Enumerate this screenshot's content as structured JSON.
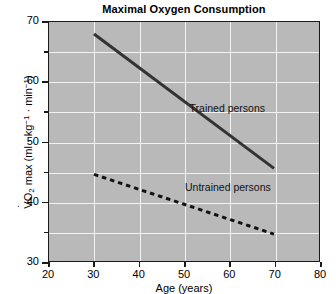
{
  "chart_data": {
    "type": "line",
    "title": "Maximal Oxygen Consumption",
    "xlabel": "Age (years)",
    "ylabel_parts": {
      "symbol": "V",
      "sub": "O",
      "sub2": "2",
      "rest": " max (ml · kg",
      "sup1": "−1",
      "mid": " · min",
      "sup2": "−1",
      "close": ")"
    },
    "ylabel_plain": "V̇O₂ max (ml · kg⁻¹ · min⁻¹)",
    "xlim": [
      20,
      80
    ],
    "ylim": [
      30,
      70
    ],
    "xticks": [
      20,
      30,
      40,
      50,
      60,
      70,
      80
    ],
    "xticklabels": [
      "20",
      "30",
      "40",
      "50",
      "60",
      "70",
      "80"
    ],
    "yticks": [
      30,
      40,
      50,
      60,
      70
    ],
    "yticklabels": [
      "30",
      "40",
      "50",
      "60",
      "70"
    ],
    "y_minor_ticks": [
      35,
      45,
      55,
      65
    ],
    "grid": true,
    "grid_color": "#f2f2f2",
    "plot_background": "#b9b9b9",
    "legend": "inline-annotations",
    "series": [
      {
        "name": "Trained persons",
        "style": "solid",
        "color": "#333333",
        "linewidth": 3,
        "x": [
          30,
          70
        ],
        "y": [
          68,
          45.5
        ],
        "label_x": 51,
        "label_y": 55.5
      },
      {
        "name": "Untrained persons",
        "style": "dashed",
        "color": "#111111",
        "linewidth": 3,
        "x": [
          30,
          70
        ],
        "y": [
          44.5,
          34.5
        ],
        "label_x": 50,
        "label_y": 42.5
      }
    ],
    "annotations": [
      {
        "text": "Trained persons",
        "x": 51,
        "y": 55.5
      },
      {
        "text": "Untrained persons",
        "x": 50,
        "y": 42.5
      }
    ]
  }
}
